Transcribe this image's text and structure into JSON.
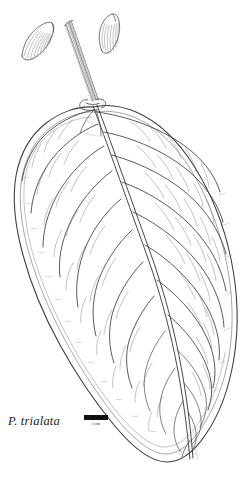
{
  "plate": {
    "kind": "botanical-line-illustration",
    "background_color": "#ffffff",
    "ink_color": "#2b2b2b",
    "subject": "leaf with two elongate buds on a peduncle"
  },
  "caption": {
    "species_label": "P. trialata"
  },
  "scale": {
    "bar_label": "1 cm",
    "bar_color": "#101010"
  },
  "parts": {
    "leaf_label": "leaf blade",
    "midrib_label": "midrib",
    "margin_label": "leaf margin",
    "venation_label": "secondary venation",
    "reticulation_label": "tertiary reticulate venation",
    "peduncle_label": "peduncle",
    "node_label": "node",
    "bud_left_label": "left flower bud",
    "bud_right_label": "right flower bud"
  }
}
